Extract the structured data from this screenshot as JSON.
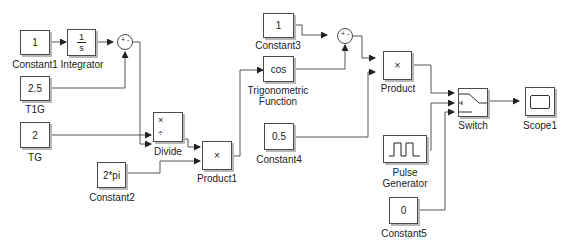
{
  "blocks": {
    "constant1": {
      "value": "1",
      "label": "Constant1"
    },
    "integrator": {
      "num": "1",
      "den": "s",
      "label": "Integrator"
    },
    "t1g": {
      "value": "2.5",
      "label": "T1G"
    },
    "tg": {
      "value": "2",
      "label": "TG"
    },
    "divide": {
      "op1": "×",
      "op2": "÷",
      "label": "Divide"
    },
    "constant2": {
      "value": "2*pi",
      "label": "Constant2"
    },
    "product1": {
      "op": "×",
      "label": "Product1"
    },
    "constant3": {
      "value": "1",
      "label": "Constant3"
    },
    "trig": {
      "value": "cos",
      "label_line1": "Trigonometric",
      "label_line2": "Function"
    },
    "constant4": {
      "value": "0.5",
      "label": "Constant4"
    },
    "product": {
      "op": "×",
      "label": "Product"
    },
    "pulse": {
      "label_line1": "Pulse",
      "label_line2": "Generator"
    },
    "constant5": {
      "value": "0",
      "label": "Constant5"
    },
    "switch": {
      "label": "Switch"
    },
    "scope1": {
      "label": "Scope1"
    },
    "sum1": {
      "signs": "+ -"
    },
    "sum2": {
      "signs": "+ -"
    }
  }
}
